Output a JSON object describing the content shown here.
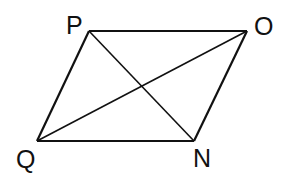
{
  "figure": {
    "type": "parallelogram-with-diagonals",
    "stroke_color": "#111111",
    "background": "#ffffff",
    "vertices": [
      {
        "label": "P",
        "x": 89,
        "y": 31,
        "label_x": 66,
        "label_y": 34
      },
      {
        "label": "O",
        "x": 247,
        "y": 31,
        "label_x": 254,
        "label_y": 35
      },
      {
        "label": "N",
        "x": 194,
        "y": 141,
        "label_x": 193,
        "label_y": 167
      },
      {
        "label": "Q",
        "x": 37,
        "y": 141,
        "label_x": 16,
        "label_y": 168
      }
    ],
    "sides": [
      [
        "P",
        "O"
      ],
      [
        "O",
        "N"
      ],
      [
        "N",
        "Q"
      ],
      [
        "Q",
        "P"
      ]
    ],
    "diagonals": [
      [
        "P",
        "N"
      ],
      [
        "Q",
        "O"
      ]
    ]
  }
}
